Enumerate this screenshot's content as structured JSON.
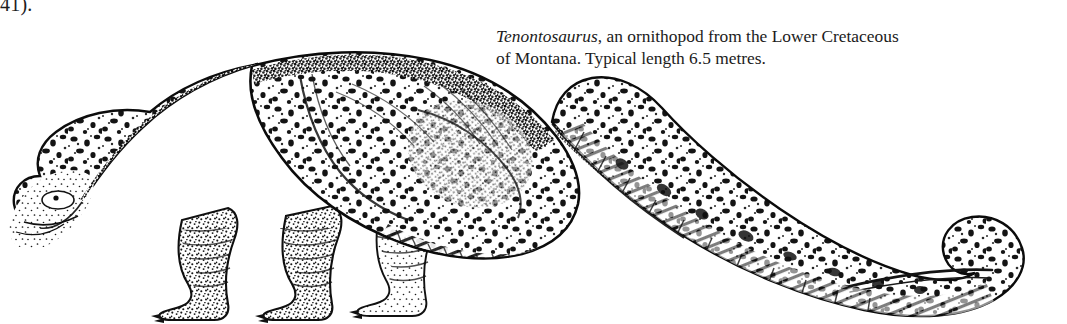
{
  "page_reference": "41).",
  "caption": {
    "genus": "Tenontosaurus",
    "rest_line1": ", an ornithopod from the Lower Cretaceous",
    "line2": "of Montana. Typical length 6.5 metres."
  },
  "figure": {
    "subject": "Tenontosaurus",
    "classification": "ornithopod",
    "period": "Lower Cretaceous",
    "locality": "Montana",
    "typical_length": "6.5 metres",
    "style": "stippled line engraving",
    "ink_color": "#111111",
    "background_color": "#ffffff"
  }
}
